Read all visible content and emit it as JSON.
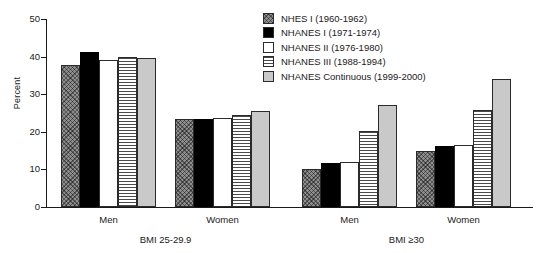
{
  "chart_data": {
    "type": "bar",
    "title": "",
    "xlabel": "",
    "ylabel": "Percent",
    "ylim": [
      0,
      50
    ],
    "yticks": [
      0,
      10,
      20,
      30,
      40,
      50
    ],
    "grid": false,
    "legend_position": "top-right",
    "categories": [
      "Men",
      "Women",
      "Men",
      "Women"
    ],
    "sections": [
      {
        "label": "BMI 25-29.9",
        "groups": [
          "Men",
          "Women"
        ]
      },
      {
        "label": "BMI ≥30",
        "groups": [
          "Men",
          "Women"
        ]
      }
    ],
    "series": [
      {
        "name": "NHES I (1960-1962)",
        "pattern": "diagonal-crosshatch-gray",
        "color": "#8e8e8e",
        "values": [
          37.9,
          23.4,
          10.2,
          15.0
        ]
      },
      {
        "name": "NHANES I (1971-1974)",
        "pattern": "solid-black",
        "color": "#000000",
        "values": [
          41.2,
          23.5,
          11.6,
          16.1
        ]
      },
      {
        "name": "NHANES II (1976-1980)",
        "pattern": "white-outline",
        "color": "#ffffff",
        "values": [
          39.2,
          23.8,
          12.0,
          16.5
        ]
      },
      {
        "name": "NHANES III (1988-1994)",
        "pattern": "horizontal-lines",
        "color": "#ffffff",
        "values": [
          39.9,
          24.4,
          20.3,
          25.9
        ]
      },
      {
        "name": "NHANES Continuous (1999-2000)",
        "pattern": "solid-light-gray",
        "color": "#c9c9c9",
        "values": [
          39.6,
          25.6,
          27.1,
          34.0
        ]
      }
    ]
  }
}
